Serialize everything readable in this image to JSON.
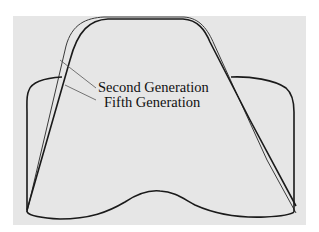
{
  "diagram": {
    "labels": {
      "second_generation": "Second Generation",
      "fifth_generation": "Fifth Generation"
    },
    "colors": {
      "background": "#e6e6e6",
      "outline_fifth": "#1a1a1a",
      "outline_second": "#3a3a3a",
      "leader": "#555555"
    }
  }
}
